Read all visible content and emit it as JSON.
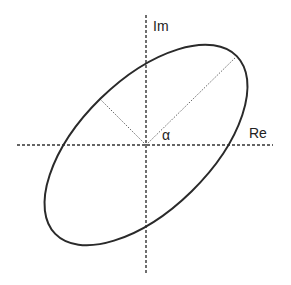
{
  "diagram": {
    "title": "",
    "axes": {
      "real_label": "Re",
      "imag_label": "Im",
      "origin": [
        146,
        145
      ],
      "real_axis": {
        "x1": 17,
        "x2": 273,
        "y": 145
      },
      "imag_axis": {
        "y1": 15,
        "y2": 274,
        "x": 146
      }
    },
    "angle_label": "α",
    "ellipse": {
      "center": [
        146,
        145
      ],
      "semi_major": 127,
      "semi_minor": 65,
      "rotation_deg": -44.4,
      "major_endpoint": [
        237,
        56
      ],
      "minor_endpoint": [
        100,
        99
      ]
    },
    "colors": {
      "stroke": "#2a2a2a",
      "axis": "#333333",
      "guide": "#555555",
      "background": "#ffffff"
    }
  }
}
